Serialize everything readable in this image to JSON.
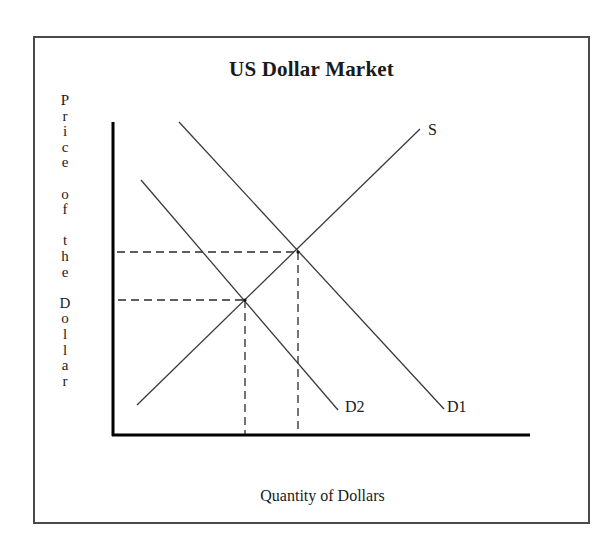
{
  "diagram": {
    "title": "US Dollar Market",
    "y_axis_label": "Price of the Dollar",
    "y_axis_letters": [
      "P",
      "r",
      "i",
      "c",
      "e",
      "",
      "o",
      "f",
      "",
      "t",
      "h",
      "e",
      "",
      "D",
      "o",
      "l",
      "l",
      "a",
      "r"
    ],
    "x_axis_label": "Quantity of Dollars",
    "curves": [
      {
        "name": "S",
        "label": "S",
        "type": "supply",
        "from": [
          137,
          405
        ],
        "to": [
          420,
          129
        ]
      },
      {
        "name": "D1",
        "label": "D1",
        "type": "demand",
        "from": [
          179,
          122
        ],
        "to": [
          444,
          409
        ]
      },
      {
        "name": "D2",
        "label": "D2",
        "type": "demand",
        "from": [
          141,
          180
        ],
        "to": [
          338,
          410
        ]
      }
    ],
    "equilibria": [
      {
        "name": "S-D1 intersection",
        "point": [
          298,
          252
        ],
        "style": "dashed"
      },
      {
        "name": "S-D2 intersection",
        "point": [
          245,
          300
        ],
        "style": "dashed"
      }
    ],
    "colors": {
      "axis": "#000000",
      "curve": "#3a3a3a",
      "dashed": "#2a2a2a",
      "frame": "#4a4a4a",
      "text": "#1a1a1a"
    }
  }
}
